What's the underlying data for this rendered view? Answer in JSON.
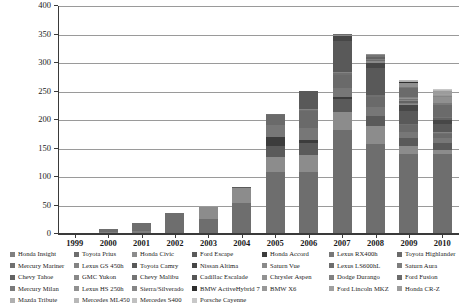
{
  "chart_data": {
    "type": "bar",
    "subtype": "stacked-bar",
    "title": "",
    "xlabel": "",
    "ylabel": "Thousand HEVs",
    "ylim": [
      0,
      400
    ],
    "yticks": [
      0,
      50,
      100,
      150,
      200,
      250,
      300,
      350,
      400
    ],
    "ytick_labels": [
      "0",
      "50",
      "100",
      "150",
      "200",
      "250",
      "300",
      "350",
      "400"
    ],
    "grid": true,
    "legend_position": "bottom",
    "categories": [
      "1999",
      "2000",
      "2001",
      "2002",
      "2003",
      "2004",
      "2005",
      "2006",
      "2007",
      "2008",
      "2009",
      "2010"
    ],
    "totals": [
      0.3,
      8,
      20,
      36,
      47,
      83,
      210,
      251,
      352,
      312,
      290,
      270
    ],
    "series": [
      {
        "name": "Honda Insight",
        "color": "#808080",
        "values": [
          0.3,
          3.8,
          4.7,
          2.2,
          1.2,
          0.6,
          0.7,
          0.7,
          0.7,
          0.0,
          0.0,
          0.0
        ]
      },
      {
        "name": "Toyota Prius",
        "color": "#6e6e6e",
        "values": [
          0.0,
          4.2,
          15.3,
          33.8,
          24.6,
          53.8,
          107.9,
          107.0,
          181.2,
          158.6,
          139.7,
          140.9
        ]
      },
      {
        "name": "Honda Civic",
        "color": "#8c8c8c",
        "values": [
          0.0,
          0.0,
          0.0,
          0.0,
          21.2,
          25.6,
          25.9,
          31.3,
          32.6,
          31.3,
          15.1,
          7.3
        ]
      },
      {
        "name": "Ford Escape",
        "color": "#5a5a5a",
        "values": [
          0.0,
          0.0,
          0.0,
          0.0,
          0.0,
          2.9,
          18.8,
          20.1,
          21.4,
          17.2,
          14.5,
          11.0
        ]
      },
      {
        "name": "Honda Accord",
        "color": "#3c3c3c",
        "values": [
          0.0,
          0.0,
          0.0,
          0.0,
          0.0,
          0.0,
          16.8,
          5.6,
          3.4,
          0.0,
          0.0,
          0.0
        ]
      },
      {
        "name": "Lexus RX400h",
        "color": "#777777",
        "values": [
          0.0,
          0.0,
          0.0,
          0.0,
          0.0,
          0.0,
          20.7,
          20.2,
          17.3,
          15.2,
          10.5,
          8.5
        ]
      },
      {
        "name": "Toyota Highlander",
        "color": "#6a6a6a",
        "values": [
          0.0,
          0.0,
          0.0,
          0.0,
          0.0,
          0.0,
          17.9,
          31.5,
          22.1,
          19.0,
          11.1,
          8.4
        ]
      },
      {
        "name": "Mercury Mariner",
        "color": "#707070",
        "values": [
          0.0,
          0.0,
          0.0,
          0.0,
          0.0,
          0.0,
          1.0,
          1.0,
          3.1,
          2.3,
          1.5,
          1.1
        ]
      },
      {
        "name": "Lexus GS 450h",
        "color": "#838383",
        "values": [
          0.0,
          0.0,
          0.0,
          0.0,
          0.0,
          0.0,
          0.0,
          1.8,
          1.6,
          0.8,
          0.4,
          0.4
        ]
      },
      {
        "name": "Toyota Camry",
        "color": "#595959",
        "values": [
          0.0,
          0.0,
          0.0,
          0.0,
          0.0,
          0.0,
          0.0,
          31.3,
          54.5,
          46.3,
          22.9,
          14.6
        ]
      },
      {
        "name": "Nissan Altima",
        "color": "#474747",
        "values": [
          0.0,
          0.0,
          0.0,
          0.0,
          0.0,
          0.0,
          0.0,
          0.0,
          8.4,
          8.8,
          9.4,
          6.7
        ]
      },
      {
        "name": "Saturn Vue",
        "color": "#8a8a8a",
        "values": [
          0.0,
          0.0,
          0.0,
          0.0,
          0.0,
          0.0,
          0.0,
          0.0,
          2.8,
          4.1,
          2.3,
          0.0
        ]
      },
      {
        "name": "Lexus LS600hL",
        "color": "#6d6d6d",
        "values": [
          0.0,
          0.0,
          0.0,
          0.0,
          0.0,
          0.0,
          0.0,
          0.0,
          0.9,
          1.0,
          0.5,
          0.3
        ]
      },
      {
        "name": "Saturn Aura",
        "color": "#7d7d7d",
        "values": [
          0.0,
          0.0,
          0.0,
          0.0,
          0.0,
          0.0,
          0.0,
          0.0,
          0.8,
          2.0,
          0.6,
          0.0
        ]
      },
      {
        "name": "Chevy Tahoe",
        "color": "#636363",
        "values": [
          0.0,
          0.0,
          0.0,
          0.0,
          0.0,
          0.0,
          0.0,
          0.0,
          0.0,
          3.0,
          3.1,
          2.2
        ]
      },
      {
        "name": "GMC Yukon",
        "color": "#888888",
        "values": [
          0.0,
          0.0,
          0.0,
          0.0,
          0.0,
          0.0,
          0.0,
          0.0,
          0.0,
          1.3,
          1.4,
          1.0
        ]
      },
      {
        "name": "Chevy Malibu",
        "color": "#747474",
        "values": [
          0.0,
          0.0,
          0.0,
          0.0,
          0.0,
          0.0,
          0.0,
          0.0,
          0.0,
          2.5,
          2.1,
          0.8
        ]
      },
      {
        "name": "Cadillac Escalade",
        "color": "#565656",
        "values": [
          0.0,
          0.0,
          0.0,
          0.0,
          0.0,
          0.0,
          0.0,
          0.0,
          0.0,
          0.8,
          1.2,
          0.9
        ]
      },
      {
        "name": "Chrysler Aspen",
        "color": "#929292",
        "values": [
          0.0,
          0.0,
          0.0,
          0.0,
          0.0,
          0.0,
          0.0,
          0.0,
          0.0,
          0.4,
          0.3,
          0.0
        ]
      },
      {
        "name": "Dodge Durango",
        "color": "#818181",
        "values": [
          0.0,
          0.0,
          0.0,
          0.0,
          0.0,
          0.0,
          0.0,
          0.0,
          0.0,
          0.4,
          0.3,
          0.0
        ]
      },
      {
        "name": "Ford Fusion",
        "color": "#6b6b6b",
        "values": [
          0.0,
          0.0,
          0.0,
          0.0,
          0.0,
          0.0,
          0.0,
          0.0,
          0.0,
          0.0,
          15.6,
          20.8
        ]
      },
      {
        "name": "Mercury Milan",
        "color": "#7a7a7a",
        "values": [
          0.0,
          0.0,
          0.0,
          0.0,
          0.0,
          0.0,
          0.0,
          0.0,
          0.0,
          0.0,
          2.2,
          2.8
        ]
      },
      {
        "name": "Lexus HS 250h",
        "color": "#909090",
        "values": [
          0.0,
          0.0,
          0.0,
          0.0,
          0.0,
          0.0,
          0.0,
          0.0,
          0.0,
          0.0,
          6.7,
          10.7
        ]
      },
      {
        "name": "Sierra/Silverado",
        "color": "#868686",
        "values": [
          0.0,
          0.0,
          0.0,
          0.0,
          0.0,
          0.0,
          0.0,
          0.0,
          0.0,
          0.0,
          1.2,
          1.5
        ]
      },
      {
        "name": "BMW ActiveHybrid 7",
        "color": "#2e2e2e",
        "values": [
          0.0,
          0.0,
          0.0,
          0.0,
          0.0,
          0.0,
          0.0,
          0.0,
          0.0,
          0.0,
          0.5,
          1.1
        ]
      },
      {
        "name": "BMW X6",
        "color": "#989898",
        "values": [
          0.0,
          0.0,
          0.0,
          0.0,
          0.0,
          0.0,
          0.0,
          0.0,
          0.0,
          0.0,
          0.3,
          0.6
        ]
      },
      {
        "name": "Ford Lincoln MKZ",
        "color": "#a0a0a0",
        "values": [
          0.0,
          0.0,
          0.0,
          0.0,
          0.0,
          0.0,
          0.0,
          0.0,
          0.0,
          0.0,
          0.0,
          1.2
        ]
      },
      {
        "name": "Honda CR-Z",
        "color": "#9c9c9c",
        "values": [
          0.0,
          0.0,
          0.0,
          0.0,
          0.0,
          0.0,
          0.0,
          0.0,
          0.0,
          0.0,
          0.0,
          5.2
        ]
      },
      {
        "name": "Mazda Tribute",
        "color": "#b0b0b0",
        "values": [
          0.0,
          0.0,
          0.0,
          0.0,
          0.0,
          0.0,
          0.0,
          0.0,
          0.0,
          0.0,
          0.4,
          0.5
        ]
      },
      {
        "name": "Mercedes ML450",
        "color": "#b8b8b8",
        "values": [
          0.0,
          0.0,
          0.0,
          0.0,
          0.0,
          0.0,
          0.0,
          0.0,
          0.0,
          0.0,
          0.2,
          0.8
        ]
      },
      {
        "name": "Mercedes S400",
        "color": "#c0c0c0",
        "values": [
          0.0,
          0.0,
          0.0,
          0.0,
          0.0,
          0.0,
          0.0,
          0.0,
          0.0,
          0.0,
          0.3,
          1.2
        ]
      },
      {
        "name": "Porsche Cayenne",
        "color": "#c8c8c8",
        "values": [
          0.0,
          0.0,
          0.0,
          0.0,
          0.0,
          0.0,
          0.0,
          0.0,
          0.0,
          0.0,
          0.0,
          0.7
        ]
      }
    ]
  },
  "legend": {
    "columns": [
      {
        "items": [
          {
            "label": "Honda Insight",
            "color": "#808080"
          },
          {
            "label": "Mercury Mariner",
            "color": "#707070"
          },
          {
            "label": "Chevy Tahoe",
            "color": "#636363"
          },
          {
            "label": "Mercury Milan",
            "color": "#7a7a7a"
          },
          {
            "label": "Mazda Tribute",
            "color": "#b0b0b0"
          }
        ]
      },
      {
        "items": [
          {
            "label": "Toyota Prius",
            "color": "#6e6e6e"
          },
          {
            "label": "Lexus GS 450h",
            "color": "#838383"
          },
          {
            "label": "GMC Yukon",
            "color": "#888888"
          },
          {
            "label": "Lexus HS 250h",
            "color": "#909090"
          },
          {
            "label": "Mercedes ML450",
            "color": "#b8b8b8"
          }
        ]
      },
      {
        "items": [
          {
            "label": "Honda Civic",
            "color": "#8c8c8c"
          },
          {
            "label": "Toyota Camry",
            "color": "#595959"
          },
          {
            "label": "Chevy Malibu",
            "color": "#747474"
          },
          {
            "label": "Sierra/Silverado",
            "color": "#868686"
          },
          {
            "label": "Mercedes S400",
            "color": "#c0c0c0"
          }
        ]
      },
      {
        "items": [
          {
            "label": "Ford Escape",
            "color": "#5a5a5a"
          },
          {
            "label": "Nissan Altima",
            "color": "#474747"
          },
          {
            "label": "Cadillac Escalade",
            "color": "#565656"
          },
          {
            "label": "BMW ActiveHybrid 7",
            "color": "#2e2e2e"
          },
          {
            "label": "Porsche Cayenne",
            "color": "#c8c8c8"
          }
        ]
      },
      {
        "items": [
          {
            "label": "Honda Accord",
            "color": "#3c3c3c"
          },
          {
            "label": "Saturn Vue",
            "color": "#8a8a8a"
          },
          {
            "label": "Chrysler Aspen",
            "color": "#929292"
          },
          {
            "label": "BMW X6",
            "color": "#989898"
          }
        ]
      },
      {
        "items": [
          {
            "label": "Lexus RX400h",
            "color": "#777777"
          },
          {
            "label": "Lexus LS600hL",
            "color": "#6d6d6d"
          },
          {
            "label": "Dodge Durango",
            "color": "#818181"
          },
          {
            "label": "Ford Lincoln MKZ",
            "color": "#a0a0a0"
          }
        ]
      },
      {
        "items": [
          {
            "label": "Toyota Highlander",
            "color": "#6a6a6a"
          },
          {
            "label": "Saturn Aura",
            "color": "#7d7d7d"
          },
          {
            "label": "Ford Fusion",
            "color": "#6b6b6b"
          },
          {
            "label": "Honda CR-Z",
            "color": "#9c9c9c"
          }
        ]
      }
    ]
  }
}
